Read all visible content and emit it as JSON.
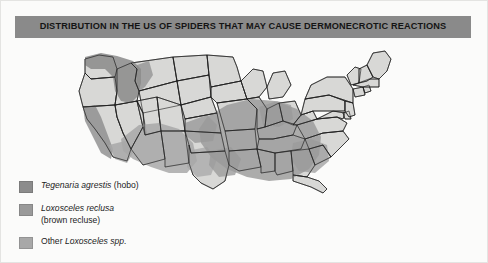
{
  "figure": {
    "title": "DISTRIBUTION IN THE US OF SPIDERS THAT MAY CAUSE DERMONECROTIC REACTIONS",
    "title_bar_color": "#8a8a8a",
    "background_color": "#fbfbfa",
    "border_color": "#e4e4e2"
  },
  "map": {
    "name": "united-states-map",
    "base_state_fill": "#d8d8d6",
    "state_border_color": "#1a1a1a",
    "outline_color": "#1a1a1a",
    "overlays": [
      {
        "id": "tegenaria-agrestis",
        "label": "Tegenaria agrestis (hobo)",
        "color": "#8c8c8c",
        "region": "Pacific Northwest: Washington, Oregon, Idaho, western Montana, northern California coast"
      },
      {
        "id": "loxosceles-reclusa",
        "label": "Loxosceles reclusa (brown recluse)",
        "color": "#9a9a9a",
        "region": "South-central and southeastern US: Missouri, Arkansas, Oklahoma, Kansas, Tennessee, Kentucky, Mississippi, Alabama, Louisiana, Texas, Georgia"
      },
      {
        "id": "other-loxosceles",
        "label": "Other Loxosceles spp.",
        "color": "#a8a8a8",
        "region": "Southwestern US: southern California, Arizona, New Mexico, southern Nevada, western Texas"
      }
    ]
  },
  "legend": {
    "name": "map-legend",
    "items": [
      {
        "swatch_color": "#8c8c8c",
        "scientific_name": "Tegenaria agrestis",
        "common_name": "(hobo)",
        "line1": "Tegenaria agrestis",
        "line1_suffix": " (hobo)",
        "line2": ""
      },
      {
        "swatch_color": "#9a9a9a",
        "scientific_name": "Loxosceles reclusa",
        "common_name": "(brown recluse)",
        "line1": "Loxosceles reclusa",
        "line1_suffix": "",
        "line2": "(brown recluse)"
      },
      {
        "swatch_color": "#a8a8a8",
        "scientific_name": "Loxosceles spp.",
        "common_name": "",
        "line1_prefix": "Other ",
        "line1": "Loxosceles spp.",
        "line1_suffix": "",
        "line2": ""
      }
    ]
  }
}
